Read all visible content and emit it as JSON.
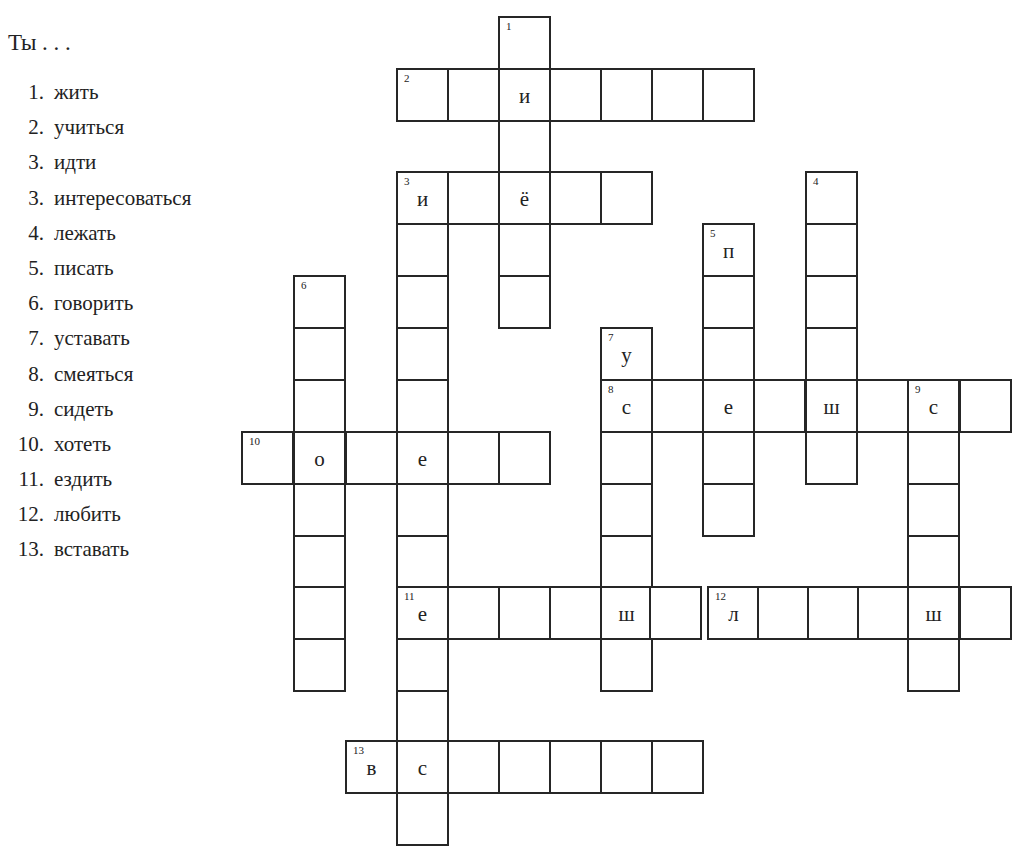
{
  "page": {
    "prompt": "Ты . . .",
    "clues": [
      {
        "num": "1.",
        "verb": "жить"
      },
      {
        "num": "2.",
        "verb": "учиться"
      },
      {
        "num": "3.",
        "verb": "идти"
      },
      {
        "num": "3.",
        "verb": "интересоваться"
      },
      {
        "num": "4.",
        "verb": "лежать"
      },
      {
        "num": "5.",
        "verb": "писать"
      },
      {
        "num": "6.",
        "verb": "говорить"
      },
      {
        "num": "7.",
        "verb": "уставать"
      },
      {
        "num": "8.",
        "verb": "смеяться"
      },
      {
        "num": "9.",
        "verb": "сидеть"
      },
      {
        "num": "10.",
        "verb": "хотеть"
      },
      {
        "num": "11.",
        "verb": "ездить"
      },
      {
        "num": "12.",
        "verb": "любить"
      },
      {
        "num": "13.",
        "verb": "вставать"
      }
    ]
  },
  "crossword": {
    "col_x": [
      241,
      293,
      345,
      396,
      447,
      498,
      549,
      600,
      651,
      702,
      753,
      805,
      856,
      907,
      959
    ],
    "row_y": [
      16,
      68,
      120,
      171,
      223,
      275,
      327,
      379,
      431,
      483,
      535,
      586,
      638,
      690,
      740,
      792
    ],
    "cells": [
      {
        "x": 498,
        "y": 16,
        "num": "1",
        "letter": ""
      },
      {
        "x": 498,
        "y": 120,
        "num": "",
        "letter": ""
      },
      {
        "x": 498,
        "y": 223,
        "num": "",
        "letter": ""
      },
      {
        "x": 498,
        "y": 275,
        "num": "",
        "letter": ""
      },
      {
        "x": 396,
        "y": 68,
        "num": "2",
        "letter": ""
      },
      {
        "x": 447,
        "y": 68,
        "num": "",
        "letter": ""
      },
      {
        "x": 498,
        "y": 68,
        "num": "",
        "letter": "и"
      },
      {
        "x": 549,
        "y": 68,
        "num": "",
        "letter": ""
      },
      {
        "x": 600,
        "y": 68,
        "num": "",
        "letter": ""
      },
      {
        "x": 651,
        "y": 68,
        "num": "",
        "letter": ""
      },
      {
        "x": 702,
        "y": 68,
        "num": "",
        "letter": ""
      },
      {
        "x": 396,
        "y": 171,
        "num": "3",
        "letter": "и"
      },
      {
        "x": 447,
        "y": 171,
        "num": "",
        "letter": ""
      },
      {
        "x": 498,
        "y": 171,
        "num": "",
        "letter": "ё"
      },
      {
        "x": 549,
        "y": 171,
        "num": "",
        "letter": ""
      },
      {
        "x": 600,
        "y": 171,
        "num": "",
        "letter": ""
      },
      {
        "x": 396,
        "y": 223,
        "num": "",
        "letter": ""
      },
      {
        "x": 396,
        "y": 275,
        "num": "",
        "letter": ""
      },
      {
        "x": 396,
        "y": 327,
        "num": "",
        "letter": ""
      },
      {
        "x": 396,
        "y": 379,
        "num": "",
        "letter": ""
      },
      {
        "x": 396,
        "y": 483,
        "num": "",
        "letter": ""
      },
      {
        "x": 396,
        "y": 535,
        "num": "",
        "letter": ""
      },
      {
        "x": 396,
        "y": 638,
        "num": "",
        "letter": ""
      },
      {
        "x": 396,
        "y": 690,
        "num": "",
        "letter": ""
      },
      {
        "x": 396,
        "y": 792,
        "num": "",
        "letter": ""
      },
      {
        "x": 805,
        "y": 171,
        "num": "4",
        "letter": ""
      },
      {
        "x": 805,
        "y": 223,
        "num": "",
        "letter": ""
      },
      {
        "x": 805,
        "y": 275,
        "num": "",
        "letter": ""
      },
      {
        "x": 805,
        "y": 327,
        "num": "",
        "letter": ""
      },
      {
        "x": 805,
        "y": 431,
        "num": "",
        "letter": ""
      },
      {
        "x": 702,
        "y": 223,
        "num": "5",
        "letter": "п"
      },
      {
        "x": 702,
        "y": 275,
        "num": "",
        "letter": ""
      },
      {
        "x": 702,
        "y": 327,
        "num": "",
        "letter": ""
      },
      {
        "x": 702,
        "y": 431,
        "num": "",
        "letter": ""
      },
      {
        "x": 702,
        "y": 483,
        "num": "",
        "letter": ""
      },
      {
        "x": 293,
        "y": 275,
        "num": "6",
        "letter": ""
      },
      {
        "x": 293,
        "y": 327,
        "num": "",
        "letter": ""
      },
      {
        "x": 293,
        "y": 379,
        "num": "",
        "letter": ""
      },
      {
        "x": 293,
        "y": 483,
        "num": "",
        "letter": ""
      },
      {
        "x": 293,
        "y": 535,
        "num": "",
        "letter": ""
      },
      {
        "x": 293,
        "y": 586,
        "num": "",
        "letter": ""
      },
      {
        "x": 293,
        "y": 638,
        "num": "",
        "letter": ""
      },
      {
        "x": 600,
        "y": 327,
        "num": "7",
        "letter": "у"
      },
      {
        "x": 600,
        "y": 431,
        "num": "",
        "letter": ""
      },
      {
        "x": 600,
        "y": 483,
        "num": "",
        "letter": ""
      },
      {
        "x": 600,
        "y": 535,
        "num": "",
        "letter": ""
      },
      {
        "x": 600,
        "y": 638,
        "num": "",
        "letter": ""
      },
      {
        "x": 600,
        "y": 379,
        "num": "8",
        "letter": "с"
      },
      {
        "x": 651,
        "y": 379,
        "num": "",
        "letter": ""
      },
      {
        "x": 702,
        "y": 379,
        "num": "",
        "letter": "е"
      },
      {
        "x": 753,
        "y": 379,
        "num": "",
        "letter": ""
      },
      {
        "x": 805,
        "y": 379,
        "num": "",
        "letter": "ш"
      },
      {
        "x": 856,
        "y": 379,
        "num": "",
        "letter": ""
      },
      {
        "x": 907,
        "y": 379,
        "num": "9",
        "letter": "с"
      },
      {
        "x": 959,
        "y": 379,
        "num": "",
        "letter": ""
      },
      {
        "x": 907,
        "y": 431,
        "num": "",
        "letter": ""
      },
      {
        "x": 907,
        "y": 483,
        "num": "",
        "letter": ""
      },
      {
        "x": 907,
        "y": 535,
        "num": "",
        "letter": ""
      },
      {
        "x": 907,
        "y": 638,
        "num": "",
        "letter": ""
      },
      {
        "x": 241,
        "y": 431,
        "num": "10",
        "letter": ""
      },
      {
        "x": 293,
        "y": 431,
        "num": "",
        "letter": "о"
      },
      {
        "x": 345,
        "y": 431,
        "num": "",
        "letter": ""
      },
      {
        "x": 396,
        "y": 431,
        "num": "",
        "letter": "е"
      },
      {
        "x": 447,
        "y": 431,
        "num": "",
        "letter": ""
      },
      {
        "x": 498,
        "y": 431,
        "num": "",
        "letter": ""
      },
      {
        "x": 396,
        "y": 586,
        "num": "11",
        "letter": "е"
      },
      {
        "x": 447,
        "y": 586,
        "num": "",
        "letter": ""
      },
      {
        "x": 498,
        "y": 586,
        "num": "",
        "letter": ""
      },
      {
        "x": 549,
        "y": 586,
        "num": "",
        "letter": ""
      },
      {
        "x": 600,
        "y": 586,
        "num": "",
        "letter": "ш"
      },
      {
        "x": 649,
        "y": 586,
        "num": "",
        "letter": ""
      },
      {
        "x": 707,
        "y": 586,
        "num": "12",
        "letter": "л"
      },
      {
        "x": 757,
        "y": 586,
        "num": "",
        "letter": ""
      },
      {
        "x": 807,
        "y": 586,
        "num": "",
        "letter": ""
      },
      {
        "x": 857,
        "y": 586,
        "num": "",
        "letter": ""
      },
      {
        "x": 907,
        "y": 586,
        "num": "",
        "letter": "ш"
      },
      {
        "x": 959,
        "y": 586,
        "num": "",
        "letter": ""
      },
      {
        "x": 345,
        "y": 740,
        "num": "13",
        "letter": "в"
      },
      {
        "x": 396,
        "y": 740,
        "num": "",
        "letter": "с"
      },
      {
        "x": 447,
        "y": 740,
        "num": "",
        "letter": ""
      },
      {
        "x": 498,
        "y": 740,
        "num": "",
        "letter": ""
      },
      {
        "x": 549,
        "y": 740,
        "num": "",
        "letter": ""
      },
      {
        "x": 600,
        "y": 740,
        "num": "",
        "letter": ""
      },
      {
        "x": 651,
        "y": 740,
        "num": "",
        "letter": ""
      }
    ]
  }
}
